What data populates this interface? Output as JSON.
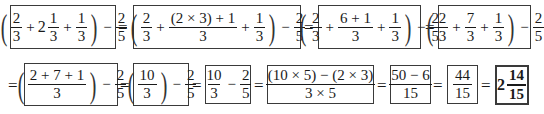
{
  "problem": "(2/3 + 2 1/3 + 1/3) - 2/5",
  "steps": [
    {
      "id": "step1",
      "expr": "(2/3 + 2 1/3 + 1/3) - 2/5",
      "parts": {
        "a_num": "2",
        "a_den": "3",
        "plus": "+",
        "whole": "2",
        "b_num": "1",
        "b_den": "3",
        "c_num": "1",
        "c_den": "3",
        "minus": "−",
        "d_num": "2",
        "d_den": "5"
      }
    },
    {
      "id": "step2",
      "expr": "(2/3 + ((2×3)+1)/3 + 1/3) - 2/5",
      "parts": {
        "a_num": "2",
        "a_den": "3",
        "plus": "+",
        "b_num": "(2 × 3) + 1",
        "b_den": "3",
        "c_num": "1",
        "c_den": "3",
        "minus": "−",
        "d_num": "2",
        "d_den": "5"
      }
    },
    {
      "id": "step3",
      "expr": "(2/3 + (6+1)/3 + 1/3) - 2/5",
      "parts": {
        "a_num": "2",
        "a_den": "3",
        "plus": "+",
        "b_num": "6 + 1",
        "b_den": "3",
        "c_num": "1",
        "c_den": "3",
        "minus": "−",
        "d_num": "2",
        "d_den": "5"
      }
    },
    {
      "id": "step4",
      "expr": "(2/3 + 7/3 + 1/3) - 2/5",
      "parts": {
        "a_num": "2",
        "a_den": "3",
        "plus": "+",
        "b_num": "7",
        "b_den": "3",
        "c_num": "1",
        "c_den": "3",
        "minus": "−",
        "d_num": "2",
        "d_den": "5"
      }
    },
    {
      "id": "step5",
      "expr": "((2+7+1)/3) - 2/5",
      "parts": {
        "a_num": "2 + 7 + 1",
        "a_den": "3",
        "minus": "−",
        "d_num": "2",
        "d_den": "5"
      }
    },
    {
      "id": "step6",
      "expr": "(10/3) - 2/5",
      "parts": {
        "a_num": "10",
        "a_den": "3",
        "minus": "−",
        "d_num": "2",
        "d_den": "5"
      }
    },
    {
      "id": "step7",
      "expr": "10/3 - 2/5",
      "parts": {
        "a_num": "10",
        "a_den": "3",
        "minus": "−",
        "d_num": "2",
        "d_den": "5"
      }
    },
    {
      "id": "step8",
      "expr": "((10×5)-(2×3))/(3×5)",
      "parts": {
        "a_num": "(10 × 5) − (2 × 3)",
        "a_den": "3 × 5"
      }
    },
    {
      "id": "step9",
      "expr": "(50-6)/15",
      "parts": {
        "a_num": "50 − 6",
        "a_den": "15"
      }
    },
    {
      "id": "step10",
      "expr": "44/15",
      "parts": {
        "a_num": "44",
        "a_den": "15"
      }
    },
    {
      "id": "step11",
      "expr": "2 14/15",
      "parts": {
        "whole": "2",
        "a_num": "14",
        "a_den": "15"
      }
    }
  ],
  "equals_sign": "=",
  "paren_open": "(",
  "paren_close": ")",
  "final_answer": "2 14/15"
}
